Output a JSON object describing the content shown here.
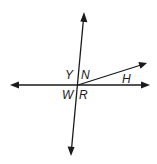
{
  "diagram": {
    "type": "geometry-intersecting-lines",
    "lines": [
      {
        "name": "horizontal-line",
        "from": [
          10,
          85
        ],
        "to": [
          150,
          85
        ],
        "arrows": [
          "start",
          "end"
        ]
      },
      {
        "name": "transversal-line",
        "from": [
          84,
          13
        ],
        "to": [
          71,
          155
        ],
        "arrows": [
          "start",
          "end"
        ]
      },
      {
        "name": "ray-h",
        "from": [
          78,
          85
        ],
        "to": [
          147,
          63
        ],
        "arrows": [
          "end"
        ]
      }
    ],
    "labels": {
      "y": "Y",
      "n": "N",
      "h": "H",
      "w": "W",
      "r": "R"
    },
    "stroke_color": "#1a1a1a",
    "background": "#ffffff"
  }
}
